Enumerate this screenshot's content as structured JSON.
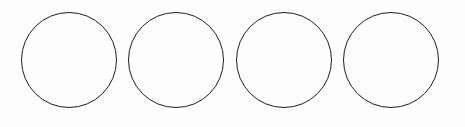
{
  "diagram": {
    "type": "shapes",
    "shape": "circle",
    "count": 4,
    "stroke_color": "#1e1e1e",
    "fill_color": "#ffffff",
    "items": [
      {
        "id": "circle-1",
        "label": ""
      },
      {
        "id": "circle-2",
        "label": ""
      },
      {
        "id": "circle-3",
        "label": ""
      },
      {
        "id": "circle-4",
        "label": ""
      }
    ]
  }
}
